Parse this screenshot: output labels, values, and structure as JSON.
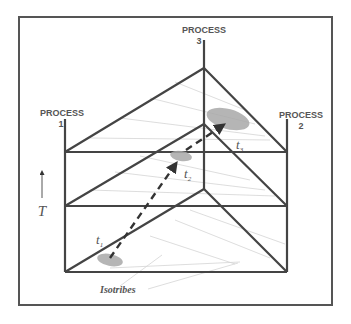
{
  "diagram": {
    "type": "triangular-prism-phase-diagram",
    "colors": {
      "frame": "#555555",
      "edges": "#444444",
      "isotribe_lines": "#d0d0d0",
      "ellipse_fill": "#a8a8a8",
      "text": "#555555",
      "background": "#ffffff"
    },
    "process_labels": [
      {
        "id": "p1",
        "title": "PROCESS",
        "number": "1"
      },
      {
        "id": "p2",
        "title": "PROCESS",
        "number": "2"
      },
      {
        "id": "p3",
        "title": "PROCESS",
        "number": "3"
      }
    ],
    "axis": {
      "variable": "T",
      "direction": "up"
    },
    "time_points": [
      {
        "id": "t1",
        "base": "t",
        "subscript": "1"
      },
      {
        "id": "t2",
        "base": "t",
        "subscript": "2"
      },
      {
        "id": "t3",
        "base": "t",
        "subscript": "3"
      }
    ],
    "isotribes_label": "Isotribes",
    "trajectory": {
      "style": "dashed-arrow",
      "from": "t1",
      "through": "t2",
      "to": "t3"
    },
    "levels": 3
  }
}
